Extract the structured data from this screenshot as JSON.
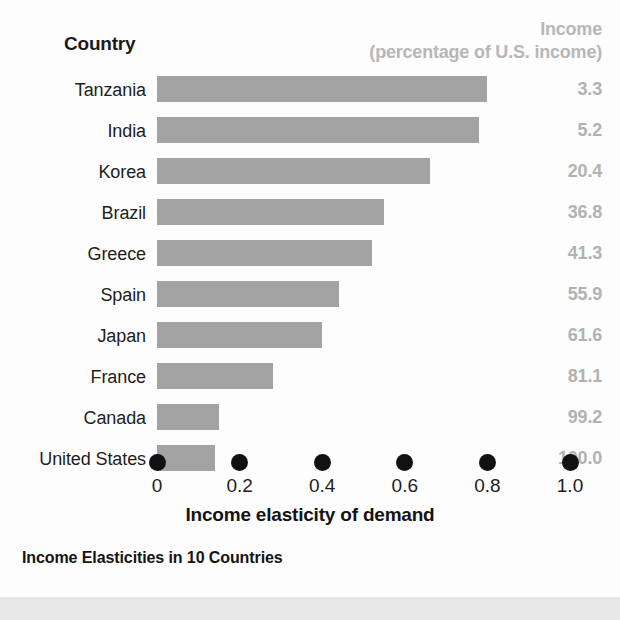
{
  "header": {
    "country_label": "Country",
    "income_line1": "Income",
    "income_line2": "(percentage of U.S. income)"
  },
  "caption": "Income Elasticities in 10 Countries",
  "colors": {
    "bar": "#a3a3a3",
    "value_text": "#b2b2b2",
    "header_text": "#b7b7b7",
    "label_text": "#1d1d1d",
    "tick_dot": "#111111",
    "panel_background": "#fdfdfd",
    "page_background": "#e7e7e7"
  },
  "chart_data": {
    "type": "bar",
    "title": "Income Elasticities in 10 Countries",
    "xlabel": "Income elasticity of demand",
    "ylabel": "Country",
    "orientation": "horizontal",
    "grid": false,
    "legend": "none",
    "xlim": [
      0,
      1.0
    ],
    "xticks": [
      "0",
      "0.2",
      "0.4",
      "0.6",
      "0.8",
      "1.0"
    ],
    "xtick_values": [
      0,
      0.2,
      0.4,
      0.6,
      0.8,
      1.0
    ],
    "categories": [
      "Tanzania",
      "India",
      "Korea",
      "Brazil",
      "Greece",
      "Spain",
      "Japan",
      "France",
      "Canada",
      "United States"
    ],
    "values": [
      0.8,
      0.78,
      0.66,
      0.55,
      0.52,
      0.44,
      0.4,
      0.28,
      0.15,
      0.14
    ],
    "series": [
      {
        "name": "Income elasticity of demand",
        "values": [
          0.8,
          0.78,
          0.66,
          0.55,
          0.52,
          0.44,
          0.4,
          0.28,
          0.15,
          0.14
        ]
      },
      {
        "name": "Income (percentage of U.S. income)",
        "values": [
          3.3,
          5.2,
          20.4,
          36.8,
          41.3,
          55.9,
          61.6,
          81.1,
          99.2,
          100.0
        ],
        "labels": [
          "3.3",
          "5.2",
          "20.4",
          "36.8",
          "41.3",
          "55.9",
          "61.6",
          "81.1",
          "99.2",
          "100.0"
        ]
      }
    ],
    "rows": [
      {
        "country": "Tanzania",
        "elasticity": 0.8,
        "income": "3.3"
      },
      {
        "country": "India",
        "elasticity": 0.78,
        "income": "5.2"
      },
      {
        "country": "Korea",
        "elasticity": 0.66,
        "income": "20.4"
      },
      {
        "country": "Brazil",
        "elasticity": 0.55,
        "income": "36.8"
      },
      {
        "country": "Greece",
        "elasticity": 0.52,
        "income": "41.3"
      },
      {
        "country": "Spain",
        "elasticity": 0.44,
        "income": "55.9"
      },
      {
        "country": "Japan",
        "elasticity": 0.4,
        "income": "61.6"
      },
      {
        "country": "France",
        "elasticity": 0.28,
        "income": "81.1"
      },
      {
        "country": "Canada",
        "elasticity": 0.15,
        "income": "99.2"
      },
      {
        "country": "United States",
        "elasticity": 0.14,
        "income": "100.0"
      }
    ]
  }
}
